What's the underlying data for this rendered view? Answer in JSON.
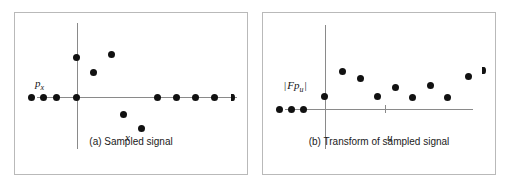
{
  "figure": {
    "background": "#ffffff",
    "border_color": "#b9b9b9",
    "axis_color": "#8a8a8a",
    "point_color": "#111111"
  },
  "chart_data": [
    {
      "type": "scatter",
      "panel_id": "a",
      "caption": "(a) Sampled signal",
      "xlabel": "x",
      "ylabel": "p",
      "ylabel_sub": "x",
      "ylabel_full": "px",
      "grid": false,
      "legend": "none",
      "axis_origin": {
        "x": 62,
        "y": 84
      },
      "xlim": [
        -62,
        172
      ],
      "ylim": [
        -79,
        84
      ],
      "points": [
        {
          "x": -46,
          "y": 0
        },
        {
          "x": -34,
          "y": 0
        },
        {
          "x": -21,
          "y": 0
        },
        {
          "x": -1,
          "y": 0
        },
        {
          "x": -1,
          "y": 40
        },
        {
          "x": 16,
          "y": 25
        },
        {
          "x": 34,
          "y": 43
        },
        {
          "x": 46,
          "y": -17
        },
        {
          "x": 64,
          "y": -31
        },
        {
          "x": 80,
          "y": 0
        },
        {
          "x": 99,
          "y": 0
        },
        {
          "x": 118,
          "y": 0
        },
        {
          "x": 137,
          "y": 0
        },
        {
          "x": 155,
          "y": 0
        }
      ]
    },
    {
      "type": "scatter",
      "panel_id": "b",
      "caption": "(b) Transform of sampled signal",
      "xlabel": "u",
      "ylabel": "|Fp|",
      "ylabel_sub": "u",
      "ylabel_full": "|Fpu|",
      "grid": false,
      "legend": "none",
      "axis_origin": {
        "x": 62,
        "y": 96
      },
      "xlim": [
        -62,
        172
      ],
      "ylim": [
        -42,
        82
      ],
      "tick_marks": [
        {
          "x": 60
        }
      ],
      "points": [
        {
          "x": -46,
          "y": 0
        },
        {
          "x": -34,
          "y": 0
        },
        {
          "x": -22,
          "y": 0
        },
        {
          "x": -1,
          "y": 13
        },
        {
          "x": 17,
          "y": 38
        },
        {
          "x": 35,
          "y": 31
        },
        {
          "x": 52,
          "y": 13
        },
        {
          "x": 70,
          "y": 22
        },
        {
          "x": 87,
          "y": 12
        },
        {
          "x": 105,
          "y": 24
        },
        {
          "x": 122,
          "y": 12
        },
        {
          "x": 143,
          "y": 33
        },
        {
          "x": 158,
          "y": 39
        }
      ]
    }
  ]
}
